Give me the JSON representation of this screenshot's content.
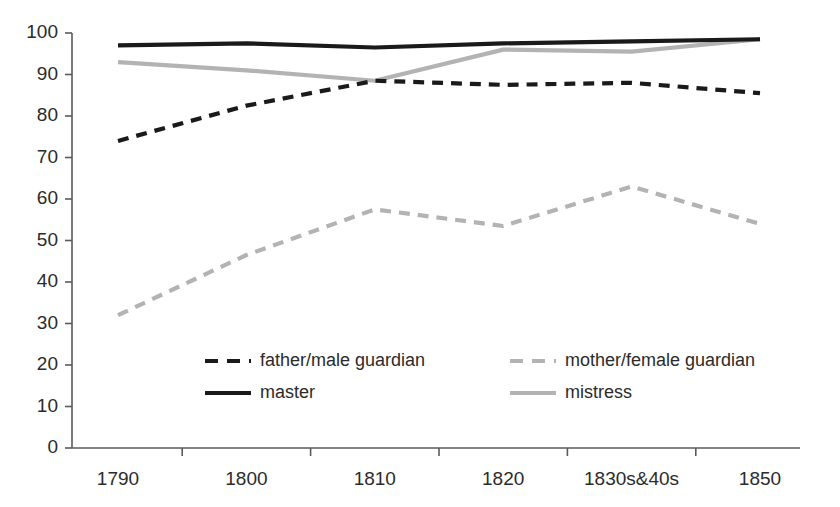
{
  "chart_data": {
    "type": "line",
    "title": "",
    "xlabel": "",
    "ylabel": "",
    "categories": [
      "1790",
      "1800",
      "1810",
      "1820",
      "1830s&40s",
      "1850"
    ],
    "ylim": [
      0,
      100
    ],
    "yticks": [
      "0",
      "10",
      "20",
      "30",
      "40",
      "50",
      "60",
      "70",
      "80",
      "90",
      "100"
    ],
    "grid": false,
    "legend_position": "inside-bottom-center",
    "series": [
      {
        "name": "father/male guardian",
        "color": "#1a1a1a",
        "style": "dashed",
        "values": [
          74,
          82.5,
          88.5,
          87.5,
          88,
          85.5
        ]
      },
      {
        "name": "mother/female guardian",
        "color": "#b3b3b3",
        "style": "dashed",
        "values": [
          32,
          46.5,
          57.5,
          53.5,
          63,
          54
        ]
      },
      {
        "name": "master",
        "color": "#1a1a1a",
        "style": "solid",
        "values": [
          97,
          97.5,
          96.5,
          97.5,
          98,
          98.5
        ]
      },
      {
        "name": "mistress",
        "color": "#b3b3b3",
        "style": "solid",
        "values": [
          93,
          91,
          88.5,
          96,
          95.5,
          98.5
        ]
      }
    ]
  },
  "axis": {
    "line_color": "#5a5a5a"
  }
}
